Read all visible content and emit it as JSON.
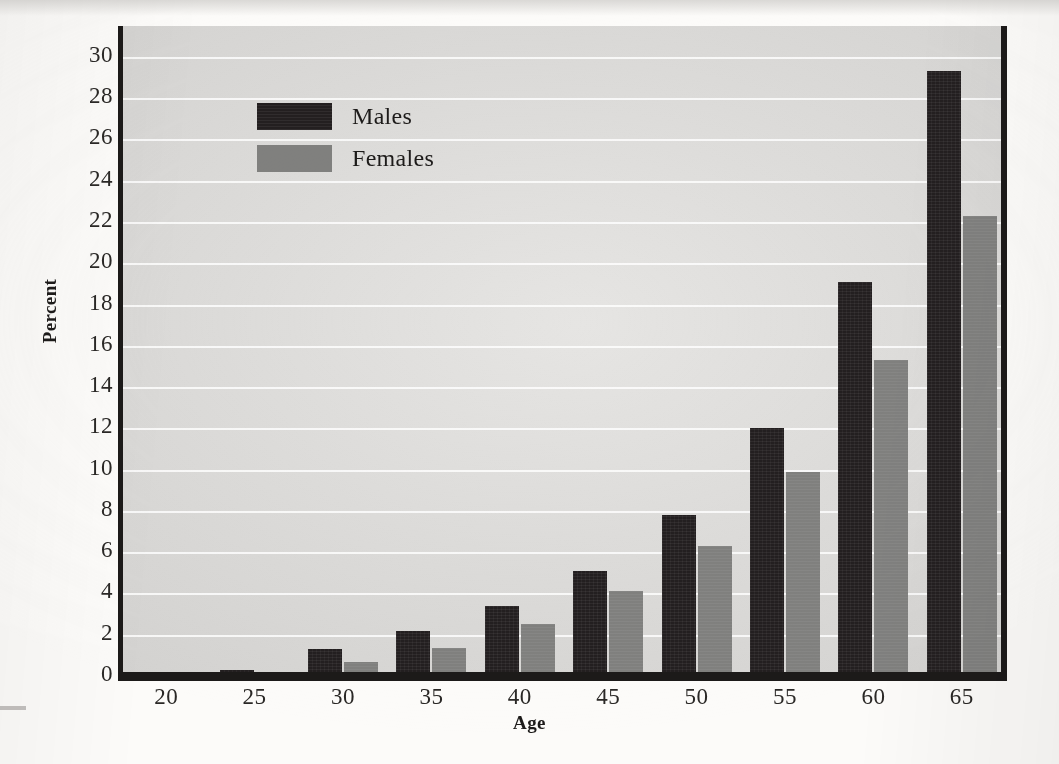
{
  "chart_data": {
    "type": "bar",
    "title": "",
    "xlabel": "Age",
    "ylabel": "Percent",
    "categories": [
      "20",
      "25",
      "30",
      "35",
      "40",
      "45",
      "50",
      "55",
      "60",
      "65"
    ],
    "series": [
      {
        "name": "Males",
        "color": "#231f20",
        "values": [
          0.0,
          0.3,
          1.3,
          2.2,
          3.4,
          5.1,
          7.8,
          12.0,
          19.1,
          29.3
        ]
      },
      {
        "name": "Females",
        "color": "#80807e",
        "values": [
          0.0,
          0.15,
          0.7,
          1.35,
          2.5,
          4.1,
          6.3,
          9.9,
          15.3,
          22.3
        ]
      }
    ],
    "ylim": [
      0,
      31.5
    ],
    "yticks": [
      "0",
      "2",
      "4",
      "6",
      "8",
      "10",
      "12",
      "14",
      "16",
      "18",
      "20",
      "22",
      "24",
      "26",
      "28",
      "30"
    ],
    "ytick_values": [
      0,
      2,
      4,
      6,
      8,
      10,
      12,
      14,
      16,
      18,
      20,
      22,
      24,
      26,
      28,
      30
    ],
    "grid": true,
    "legend_position": "upper-left-inside",
    "legend": [
      "Males",
      "Females"
    ],
    "plot_background": "#dcdbd9",
    "gridline_color": "#ffffff",
    "axis_color": "#1c1a19"
  }
}
